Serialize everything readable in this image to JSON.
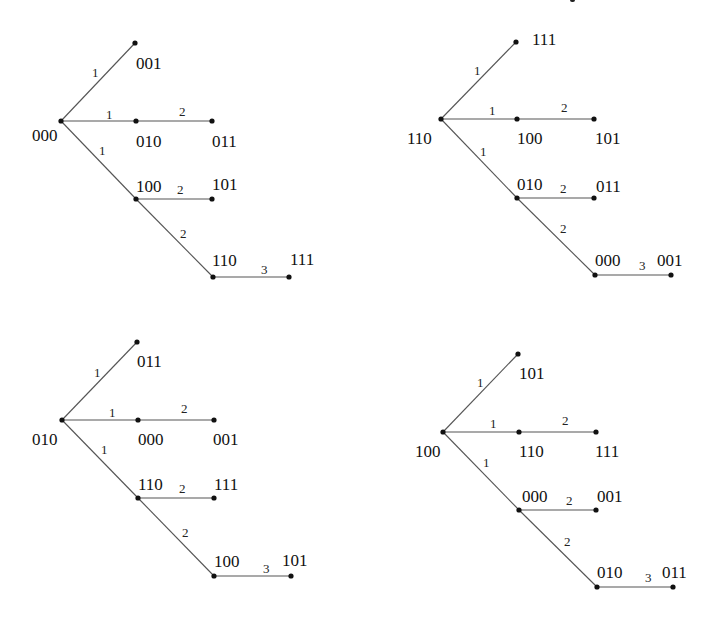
{
  "diagram": {
    "type": "spanning-trees-of-3-cube",
    "trees": [
      {
        "root": "000",
        "nodes": [
          {
            "id": "000",
            "x": 61,
            "y": 121,
            "lx": 32,
            "ly": 127
          },
          {
            "id": "001",
            "x": 135,
            "y": 43,
            "lx": 136,
            "ly": 55
          },
          {
            "id": "010",
            "x": 136,
            "y": 121,
            "lx": 136,
            "ly": 133
          },
          {
            "id": "011",
            "x": 212,
            "y": 121,
            "lx": 212,
            "ly": 133
          },
          {
            "id": "100",
            "x": 136,
            "y": 199,
            "lx": 136,
            "ly": 178
          },
          {
            "id": "101",
            "x": 212,
            "y": 199,
            "lx": 212,
            "ly": 176
          },
          {
            "id": "110",
            "x": 213,
            "y": 277,
            "lx": 212,
            "ly": 252
          },
          {
            "id": "111",
            "x": 289,
            "y": 277,
            "lx": 290,
            "ly": 251
          }
        ],
        "edges": [
          {
            "from": "000",
            "to": "001",
            "label": "1",
            "lx": 92,
            "ly": 66
          },
          {
            "from": "000",
            "to": "010",
            "label": "1",
            "lx": 106,
            "ly": 108
          },
          {
            "from": "010",
            "to": "011",
            "label": "2",
            "lx": 179,
            "ly": 105
          },
          {
            "from": "000",
            "to": "100",
            "label": "1",
            "lx": 99,
            "ly": 144
          },
          {
            "from": "100",
            "to": "101",
            "label": "2",
            "lx": 177,
            "ly": 183
          },
          {
            "from": "100",
            "to": "110",
            "label": "2",
            "lx": 180,
            "ly": 227
          },
          {
            "from": "110",
            "to": "111",
            "label": "3",
            "lx": 261,
            "ly": 263
          }
        ]
      },
      {
        "root": "110",
        "nodes": [
          {
            "id": "110",
            "x": 441,
            "y": 119,
            "lx": 407,
            "ly": 130
          },
          {
            "id": "111",
            "x": 516,
            "y": 42,
            "lx": 532,
            "ly": 31
          },
          {
            "id": "100",
            "x": 517,
            "y": 119,
            "lx": 517,
            "ly": 130
          },
          {
            "id": "101",
            "x": 594,
            "y": 119,
            "lx": 595,
            "ly": 130
          },
          {
            "id": "010",
            "x": 517,
            "y": 198,
            "lx": 517,
            "ly": 176
          },
          {
            "id": "011",
            "x": 594,
            "y": 198,
            "lx": 596,
            "ly": 178
          },
          {
            "id": "000",
            "x": 595,
            "y": 275,
            "lx": 595,
            "ly": 252
          },
          {
            "id": "001",
            "x": 671,
            "y": 275,
            "lx": 657,
            "ly": 252
          }
        ],
        "edges": [
          {
            "from": "110",
            "to": "111",
            "label": "1",
            "lx": 474,
            "ly": 64
          },
          {
            "from": "110",
            "to": "100",
            "label": "1",
            "lx": 489,
            "ly": 104
          },
          {
            "from": "100",
            "to": "101",
            "label": "2",
            "lx": 561,
            "ly": 101
          },
          {
            "from": "110",
            "to": "010",
            "label": "1",
            "lx": 480,
            "ly": 145
          },
          {
            "from": "010",
            "to": "011",
            "label": "2",
            "lx": 560,
            "ly": 182
          },
          {
            "from": "010",
            "to": "000",
            "label": "2",
            "lx": 560,
            "ly": 222
          },
          {
            "from": "000",
            "to": "001",
            "label": "3",
            "lx": 639,
            "ly": 259
          }
        ]
      },
      {
        "root": "010",
        "nodes": [
          {
            "id": "010",
            "x": 62,
            "y": 420,
            "lx": 32,
            "ly": 431
          },
          {
            "id": "011",
            "x": 137,
            "y": 342,
            "lx": 137,
            "ly": 353
          },
          {
            "id": "000",
            "x": 138,
            "y": 420,
            "lx": 138,
            "ly": 431
          },
          {
            "id": "001",
            "x": 214,
            "y": 420,
            "lx": 213,
            "ly": 431
          },
          {
            "id": "110",
            "x": 138,
            "y": 498,
            "lx": 138,
            "ly": 476
          },
          {
            "id": "111",
            "x": 214,
            "y": 498,
            "lx": 214,
            "ly": 476
          },
          {
            "id": "100",
            "x": 214,
            "y": 576,
            "lx": 214,
            "ly": 553
          },
          {
            "id": "101",
            "x": 291,
            "y": 576,
            "lx": 282,
            "ly": 552
          }
        ],
        "edges": [
          {
            "from": "010",
            "to": "011",
            "label": "1",
            "lx": 94,
            "ly": 366
          },
          {
            "from": "010",
            "to": "000",
            "label": "1",
            "lx": 109,
            "ly": 406
          },
          {
            "from": "000",
            "to": "001",
            "label": "2",
            "lx": 181,
            "ly": 402
          },
          {
            "from": "010",
            "to": "110",
            "label": "1",
            "lx": 101,
            "ly": 443
          },
          {
            "from": "110",
            "to": "111",
            "label": "2",
            "lx": 179,
            "ly": 482
          },
          {
            "from": "110",
            "to": "100",
            "label": "2",
            "lx": 182,
            "ly": 526
          },
          {
            "from": "100",
            "to": "101",
            "label": "3",
            "lx": 263,
            "ly": 562
          }
        ]
      },
      {
        "root": "100",
        "nodes": [
          {
            "id": "100",
            "x": 443,
            "y": 432,
            "lx": 415,
            "ly": 443
          },
          {
            "id": "101",
            "x": 518,
            "y": 354,
            "lx": 519,
            "ly": 365
          },
          {
            "id": "110",
            "x": 519,
            "y": 432,
            "lx": 519,
            "ly": 443
          },
          {
            "id": "111",
            "x": 596,
            "y": 432,
            "lx": 595,
            "ly": 443
          },
          {
            "id": "000",
            "x": 519,
            "y": 510,
            "lx": 522,
            "ly": 488
          },
          {
            "id": "001",
            "x": 596,
            "y": 510,
            "lx": 597,
            "ly": 488
          },
          {
            "id": "010",
            "x": 597,
            "y": 587,
            "lx": 597,
            "ly": 564
          },
          {
            "id": "011",
            "x": 673,
            "y": 587,
            "lx": 662,
            "ly": 564
          }
        ],
        "edges": [
          {
            "from": "100",
            "to": "101",
            "label": "1",
            "lx": 477,
            "ly": 376
          },
          {
            "from": "100",
            "to": "110",
            "label": "1",
            "lx": 490,
            "ly": 417
          },
          {
            "from": "110",
            "to": "111",
            "label": "2",
            "lx": 562,
            "ly": 414
          },
          {
            "from": "100",
            "to": "000",
            "label": "1",
            "lx": 483,
            "ly": 456
          },
          {
            "from": "000",
            "to": "001",
            "label": "2",
            "lx": 566,
            "ly": 494
          },
          {
            "from": "000",
            "to": "010",
            "label": "2",
            "lx": 564,
            "ly": 535
          },
          {
            "from": "010",
            "to": "011",
            "label": "3",
            "lx": 645,
            "ly": 571
          }
        ]
      }
    ]
  }
}
